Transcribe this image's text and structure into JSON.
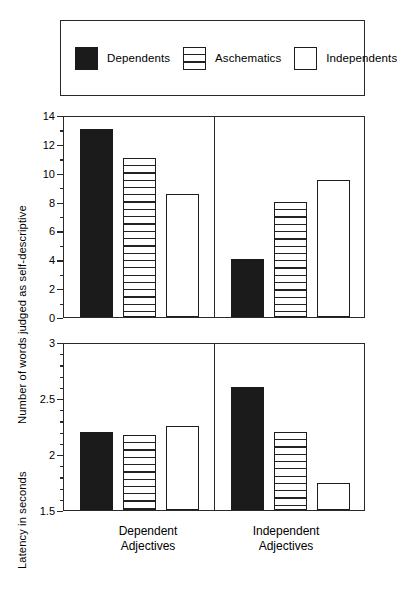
{
  "legend": {
    "items": [
      {
        "label": "Dependents",
        "fill": "solid"
      },
      {
        "label": "Aschematics",
        "fill": "hatch"
      },
      {
        "label": "Independents",
        "fill": "open"
      }
    ]
  },
  "groups": [
    "Dependent\nAdjectives",
    "Independent\nAdjectives"
  ],
  "group_labels": [
    {
      "line1": "Dependent",
      "line2": "Adjectives"
    },
    {
      "line1": "Independent",
      "line2": "Adjectives"
    }
  ],
  "chart_data": [
    {
      "type": "bar",
      "title": "",
      "xlabel": "",
      "ylabel": "Number of words judged as self-descriptive",
      "categories": [
        "Dependent Adjectives",
        "Independent Adjectives"
      ],
      "series": [
        {
          "name": "Dependents",
          "values": [
            13,
            4
          ]
        },
        {
          "name": "Aschematics",
          "values": [
            11,
            8
          ]
        },
        {
          "name": "Independents",
          "values": [
            8.5,
            9.5
          ]
        }
      ],
      "ylim": [
        0,
        14
      ],
      "yticks": [
        0,
        2,
        4,
        6,
        8,
        10,
        12,
        14
      ],
      "ytick_labels": [
        "0",
        "2",
        "4",
        "6",
        "8",
        "10",
        "12",
        "14"
      ],
      "yminor_step": 1,
      "grid": false,
      "legend_position": "top"
    },
    {
      "type": "bar",
      "title": "",
      "xlabel": "",
      "ylabel": "Latency in seconds",
      "categories": [
        "Dependent Adjectives",
        "Independent Adjectives"
      ],
      "series": [
        {
          "name": "Dependents",
          "values": [
            2.2,
            2.6
          ]
        },
        {
          "name": "Aschematics",
          "values": [
            2.17,
            2.2
          ]
        },
        {
          "name": "Independents",
          "values": [
            2.25,
            1.74
          ]
        }
      ],
      "ylim": [
        1.5,
        3
      ],
      "yticks": [
        1.5,
        2,
        2.5,
        3
      ],
      "ytick_labels": [
        "1.5",
        "2",
        "2.5",
        "3"
      ],
      "yminor_step": 0.1,
      "grid": false,
      "legend_position": "top"
    }
  ],
  "colors": {
    "ink": "#1d1d1d",
    "frame": "#2a2a2a",
    "solid_fill": "#1b1b1b",
    "open_fill": "#ffffff",
    "background": "#ffffff"
  }
}
